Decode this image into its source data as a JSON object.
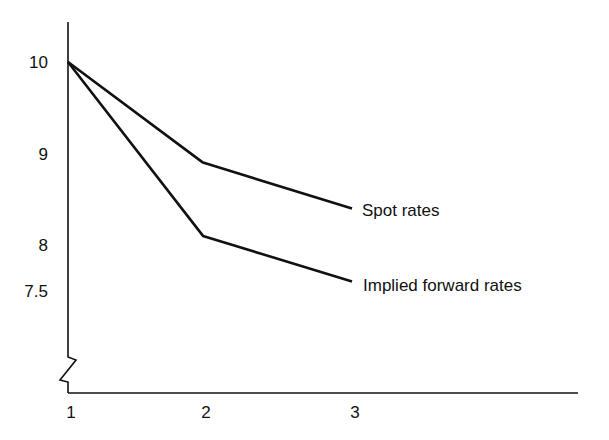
{
  "chart_data": {
    "type": "line",
    "title": "",
    "xlabel": "",
    "ylabel": "",
    "x": [
      1,
      2,
      3
    ],
    "x_tick_labels": [
      "1",
      "2",
      "3"
    ],
    "y_tick_labels": [
      "10",
      "9",
      "8",
      "7.5"
    ],
    "y_ticks": [
      10,
      9,
      8,
      7.5
    ],
    "ylim": [
      7.0,
      10.5
    ],
    "y_axis_break": true,
    "grid": false,
    "legend": "inline labels at line ends",
    "series": [
      {
        "name": "Spot rates",
        "label": "Spot rates",
        "values": [
          10,
          8.9,
          8.4
        ]
      },
      {
        "name": "Implied forward rates",
        "label": "Implied forward rates",
        "values": [
          10,
          8.1,
          7.6
        ]
      }
    ]
  }
}
